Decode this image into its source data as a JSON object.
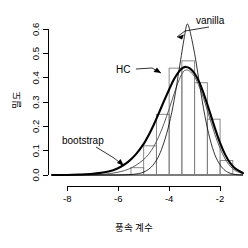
{
  "chart_data": {
    "type": "line",
    "title": "",
    "xlabel": "풍속 계수",
    "ylabel": "밀도",
    "xlim": [
      -8.6,
      -1.1
    ],
    "ylim": [
      0.0,
      0.63
    ],
    "xticks": [
      -8,
      -6,
      -4,
      -2
    ],
    "xtick_labels": [
      "-8",
      "-6",
      "-4",
      "-2"
    ],
    "yticks": [
      0.0,
      0.1,
      0.2,
      0.3,
      0.4,
      0.5,
      0.6
    ],
    "ytick_labels": [
      "0.0",
      "0.1",
      "0.2",
      "0.3",
      "0.4",
      "0.5",
      "0.6"
    ],
    "grid": false,
    "legend": "annotations",
    "histogram": {
      "name": "histogram",
      "bin_edges": [
        -5.5,
        -5.0,
        -4.5,
        -4.0,
        -3.5,
        -3.0,
        -2.5,
        -2.0,
        -1.5
      ],
      "densities": [
        0.03,
        0.12,
        0.25,
        0.44,
        0.47,
        0.38,
        0.23,
        0.06
      ],
      "stroke_color": "#7d7d7d"
    },
    "series": [
      {
        "name": "vanilla",
        "label": "vanilla",
        "peak_x": -3.3,
        "peak_y": 0.62,
        "mean": -3.3,
        "sd": 0.64,
        "line_width": "thin",
        "color": "#000000",
        "x": [
          -8.6,
          -8.0,
          -7.5,
          -7.0,
          -6.5,
          -6.0,
          -5.5,
          -5.2,
          -5.0,
          -4.8,
          -4.6,
          -4.4,
          -4.2,
          -4.0,
          -3.8,
          -3.6,
          -3.4,
          -3.3,
          -3.2,
          -3.0,
          -2.8,
          -2.6,
          -2.4,
          -2.2,
          -2.0,
          -1.8,
          -1.6,
          -1.4,
          -1.1
        ],
        "y": [
          0.0,
          0.0,
          0.0,
          0.0,
          0.0,
          0.0,
          0.002,
          0.006,
          0.012,
          0.024,
          0.045,
          0.08,
          0.135,
          0.21,
          0.31,
          0.44,
          0.57,
          0.62,
          0.6,
          0.5,
          0.37,
          0.245,
          0.15,
          0.082,
          0.042,
          0.018,
          0.007,
          0.002,
          0.0
        ]
      },
      {
        "name": "HC",
        "label": "HC",
        "peak_x": -3.35,
        "peak_y": 0.445,
        "mean": -3.35,
        "sd": 0.9,
        "line_width": "thick",
        "color": "#000000",
        "x": [
          -8.6,
          -8.0,
          -7.5,
          -7.0,
          -6.6,
          -6.2,
          -5.9,
          -5.6,
          -5.3,
          -5.0,
          -4.8,
          -4.6,
          -4.4,
          -4.2,
          -4.0,
          -3.8,
          -3.6,
          -3.45,
          -3.35,
          -3.2,
          -3.0,
          -2.8,
          -2.6,
          -2.4,
          -2.2,
          -2.0,
          -1.8,
          -1.6,
          -1.4,
          -1.1
        ],
        "y": [
          0.0,
          0.0,
          0.002,
          0.005,
          0.01,
          0.02,
          0.034,
          0.055,
          0.086,
          0.128,
          0.165,
          0.208,
          0.256,
          0.305,
          0.352,
          0.396,
          0.428,
          0.442,
          0.445,
          0.44,
          0.418,
          0.378,
          0.322,
          0.258,
          0.192,
          0.132,
          0.084,
          0.049,
          0.026,
          0.008
        ]
      },
      {
        "name": "bootstrap",
        "label": "bootstrap",
        "peak_x": -3.35,
        "peak_y": 0.432,
        "line_width": "thin",
        "color": "#4a4a4a",
        "x": [
          -8.6,
          -8.0,
          -7.5,
          -7.0,
          -6.5,
          -6.2,
          -5.9,
          -5.6,
          -5.3,
          -5.0,
          -4.8,
          -4.6,
          -4.4,
          -4.2,
          -4.0,
          -3.8,
          -3.6,
          -3.45,
          -3.35,
          -3.2,
          -3.0,
          -2.8,
          -2.6,
          -2.4,
          -2.2,
          -2.0,
          -1.8,
          -1.6,
          -1.4,
          -1.1
        ],
        "y": [
          0.0,
          0.0,
          0.0,
          0.001,
          0.004,
          0.008,
          0.014,
          0.024,
          0.04,
          0.064,
          0.086,
          0.118,
          0.16,
          0.212,
          0.272,
          0.336,
          0.394,
          0.424,
          0.432,
          0.428,
          0.404,
          0.36,
          0.3,
          0.232,
          0.166,
          0.11,
          0.066,
          0.036,
          0.018,
          0.005
        ]
      }
    ],
    "annotations": [
      {
        "name": "vanilla",
        "text": "vanilla",
        "target_x": -3.05,
        "target_y": 0.545
      },
      {
        "name": "HC",
        "text": "HC",
        "target_x": -3.5,
        "target_y": 0.425
      },
      {
        "name": "bootstrap",
        "text": "bootstrap",
        "target_x": -4.35,
        "target_y": 0.048
      }
    ]
  }
}
